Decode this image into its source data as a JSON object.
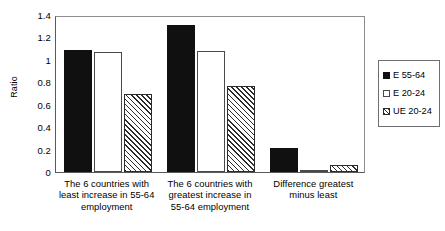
{
  "chart_data": {
    "type": "bar",
    "title": "",
    "xlabel": "",
    "ylabel": "Ratio",
    "ylim": [
      0,
      1.4
    ],
    "yticks": [
      "0",
      "0.2",
      "0.4",
      "0.6",
      "0.8",
      "1",
      "1.2",
      "1.4"
    ],
    "ytick_values": [
      0,
      0.2,
      0.4,
      0.6,
      0.8,
      1.0,
      1.2,
      1.4
    ],
    "grid": false,
    "legend_position": "right",
    "categories": [
      "The 6 countries with least increase in 55-64 employment",
      "The 6 countries with greatest increase in 55-64 employment",
      "Difference greatest minus least"
    ],
    "category_lines": [
      [
        "The 6 countries with",
        "least increase in 55-64",
        "employment"
      ],
      [
        "The 6 countries with",
        "greatest increase in",
        "55-64 employment"
      ],
      [
        "Difference greatest",
        "minus least"
      ]
    ],
    "series": [
      {
        "name": "E 55-64",
        "fill": "solid-black",
        "values": [
          1.09,
          1.31,
          0.21
        ]
      },
      {
        "name": "E 20-24",
        "fill": "white",
        "values": [
          1.07,
          1.08,
          0.01
        ]
      },
      {
        "name": "UE 20-24",
        "fill": "hatched",
        "values": [
          0.7,
          0.77,
          0.06
        ]
      }
    ]
  },
  "legend": {
    "entries": [
      {
        "label": "E 55-64"
      },
      {
        "label": "E 20-24"
      },
      {
        "label": "UE 20-24"
      }
    ]
  },
  "colors": {
    "series_black": "#101010",
    "series_white": "#ffffff",
    "hatch_line": "#2b2b2b",
    "axis": "#5a5a5a",
    "text": "#000000",
    "background": "#ffffff"
  }
}
